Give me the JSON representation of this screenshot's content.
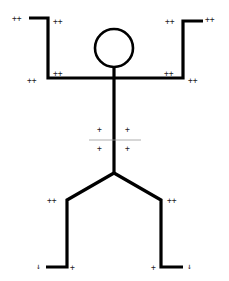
{
  "figure": {
    "colors": {
      "background": "#ffffff",
      "stroke": "#000000",
      "annotation": "#222222",
      "guide_line": "#9a9a9a"
    }
  },
  "annotations": {
    "left_hand_outer": "++",
    "left_hand_inner": "++",
    "right_hand_inner": "++",
    "right_hand_outer": "++",
    "left_shoulder_outer": "++",
    "left_shoulder_inner": "++",
    "right_shoulder_inner": "++",
    "right_shoulder_outer": "++",
    "torso_upper_left": "+",
    "torso_upper_right": "+",
    "torso_lower_left": "+",
    "torso_lower_right": "+",
    "left_knee": "++",
    "right_knee": "++",
    "left_foot_outer": "↓",
    "left_foot_inner": "+",
    "right_foot_inner": "+",
    "right_foot_outer": "↓"
  }
}
